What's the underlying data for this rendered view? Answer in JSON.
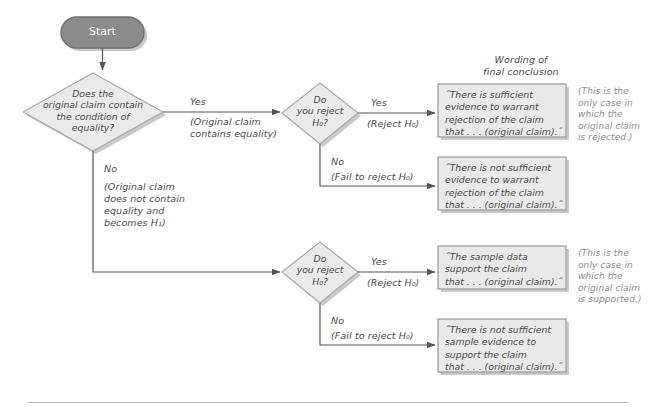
{
  "diagram": {
    "title_note": "Wording of\nfinal conclusion",
    "start": {
      "label": "Start"
    },
    "decision_equality": {
      "text": "Does the\noriginal claim contain\nthe condition of\nequality?"
    },
    "decision_reject_top": {
      "text": "Do\nyou reject\nH₀?"
    },
    "decision_reject_bottom": {
      "text": "Do\nyou reject\nH₀?"
    },
    "branches": {
      "equality_yes": "Yes",
      "equality_yes_note": "(Original claim\ncontains equality)",
      "equality_no": "No",
      "equality_no_note": "(Original claim\ndoes not contain\nequality and\nbecomes H₁)",
      "top_yes": "Yes",
      "top_yes_note": "(Reject H₀)",
      "top_no": "No",
      "top_no_note": "(Fail to reject H₀)",
      "bottom_yes": "Yes",
      "bottom_yes_note": "(Reject H₀)",
      "bottom_no": "No",
      "bottom_no_note": "(Fail to reject H₀)"
    },
    "conclusions": [
      {
        "id": "reject-claim",
        "text": "˝There is sufficient\nevidence to warrant\nrejection of the claim\nthat . . . (original claim).˝"
      },
      {
        "id": "fail-reject-claim",
        "text": "˝There is not sufficient\nevidence to warrant\nrejection of the claim\nthat . . . (original claim).˝"
      },
      {
        "id": "support-claim",
        "text": "˝The sample data\nsupport the claim\nthat . . . (original claim).˝"
      },
      {
        "id": "fail-support-claim",
        "text": "˝There is not sufficient\nsample evidence to\nsupport the claim\nthat . . . (original claim).˝"
      }
    ],
    "side_notes": [
      {
        "id": "rejected-note",
        "text": "(This is the\nonly case in\nwhich the\noriginal claim\nis rejected.)"
      },
      {
        "id": "supported-note",
        "text": "(This is the\nonly case in\nwhich the\noriginal claim\nis supported.)"
      }
    ],
    "colors": {
      "start_fill": "#8b8b8b",
      "start_stroke": "#6f6f6f",
      "diamond_fill": "#eaeaea",
      "diamond_stroke": "#a8a8a8",
      "box_fill": "#e9e9e9",
      "box_stroke": "#9a9a9a",
      "shadow": "#c9c9c9",
      "connector": "#555555",
      "rule": "#b9b9b9"
    }
  }
}
